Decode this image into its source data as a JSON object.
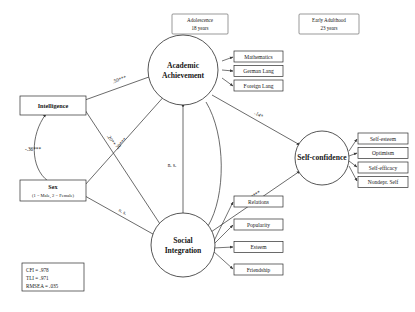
{
  "figure": {
    "type": "structural-equation-model",
    "background": "#ffffff",
    "line_color": "#3a3a3a"
  },
  "periods": [
    {
      "id": "adolescence",
      "line1": "Adolescence",
      "line2": "18 years"
    },
    {
      "id": "early-adulthood",
      "line1": "Early Adulthood",
      "line2": "23 years"
    }
  ],
  "observed": {
    "intelligence": {
      "label": "Intelligence"
    },
    "sex": {
      "label": "Sex",
      "sublabel": "(1 = Male, 2 = Female)"
    }
  },
  "latents": [
    {
      "id": "academic-achievement",
      "line1": "Academic",
      "line2": "Achievement"
    },
    {
      "id": "social-integration",
      "line1": "Social",
      "line2": "Integration"
    },
    {
      "id": "self-confidence",
      "line1": "Self-confidence",
      "line2": ""
    }
  ],
  "indicators": {
    "academic_achievement": [
      "Mathematics",
      "German Lang",
      "Foreign Lang"
    ],
    "self_confidence": [
      "Self-esteem",
      "Optimism",
      "Self-efficacy",
      "Nondepr. Self"
    ],
    "social_integration": [
      "Relations",
      "Popularity",
      "Esteem",
      "Friendship"
    ]
  },
  "paths": [
    {
      "id": "intelligence-to-academic",
      "label": ".50***"
    },
    {
      "id": "sex-to-intelligence",
      "label": "-.36***"
    },
    {
      "id": "intelligence-to-social",
      "label": ".20**"
    },
    {
      "id": "sex-to-academic",
      "label": ".20***"
    },
    {
      "id": "sex-to-social",
      "label": "n. s."
    },
    {
      "id": "academic-to-social",
      "label": "n. s."
    },
    {
      "id": "academic-to-selfconfidence",
      "label": ".14*"
    },
    {
      "id": "social-to-selfconfidence",
      "label": ".34***"
    }
  ],
  "fit_statistics": [
    "CFI = .978",
    "TLI = .971",
    "RMSEA = .035"
  ]
}
